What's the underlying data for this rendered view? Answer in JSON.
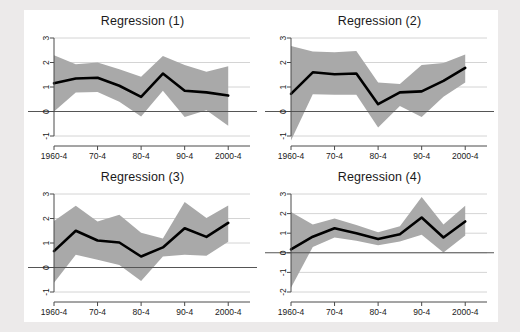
{
  "figure": {
    "background_color": "#eceaea",
    "panel_background_color": "#ffffff",
    "band_color": "#a9a9a9",
    "line_color": "#000000",
    "grid_color": "#c9c9c9",
    "zero_line_color": "#555555"
  },
  "chart_data": [
    {
      "type": "line",
      "title": "Regression (1)",
      "xlabel": "",
      "ylabel": "",
      "grid": true,
      "legend": "none",
      "xlim": [
        0,
        9
      ],
      "ylim": [
        -1,
        3
      ],
      "yticks": [
        3,
        2,
        1,
        0,
        -1
      ],
      "ytick_labels": [
        "3",
        "2",
        "1",
        "0",
        "-1"
      ],
      "xticks": [
        0,
        2,
        4,
        6,
        8
      ],
      "xtick_labels": [
        "1960-4",
        "70-4",
        "80-4",
        "90-4",
        "2000-4"
      ],
      "x": [
        0,
        1,
        2,
        3,
        4,
        5,
        6,
        7,
        8
      ],
      "series": [
        {
          "name": "coefficient",
          "values": [
            1.15,
            1.35,
            1.38,
            1.05,
            0.6,
            1.55,
            0.85,
            0.78,
            0.65
          ]
        },
        {
          "name": "ci_upper",
          "values": [
            2.3,
            1.93,
            2.0,
            1.72,
            1.42,
            2.27,
            1.9,
            1.62,
            1.85
          ]
        },
        {
          "name": "ci_lower",
          "values": [
            0.0,
            0.78,
            0.8,
            0.4,
            -0.2,
            0.85,
            -0.22,
            0.05,
            -0.58
          ]
        }
      ]
    },
    {
      "type": "line",
      "title": "Regression (2)",
      "xlabel": "",
      "ylabel": "",
      "grid": true,
      "legend": "none",
      "xlim": [
        0,
        9
      ],
      "ylim": [
        -1,
        3
      ],
      "yticks": [
        3,
        2,
        1,
        0,
        -1
      ],
      "ytick_labels": [
        "3",
        "2",
        "1",
        "0",
        "-1"
      ],
      "xticks": [
        0,
        2,
        4,
        6,
        8
      ],
      "xtick_labels": [
        "1960-4",
        "70-4",
        "80-4",
        "90-4",
        "2000-4"
      ],
      "x": [
        0,
        1,
        2,
        3,
        4,
        5,
        6,
        7,
        8
      ],
      "series": [
        {
          "name": "coefficient",
          "values": [
            0.72,
            1.6,
            1.52,
            1.55,
            0.3,
            0.78,
            0.82,
            1.25,
            1.78
          ]
        },
        {
          "name": "ci_upper",
          "values": [
            2.67,
            2.45,
            2.42,
            2.47,
            1.18,
            1.12,
            1.9,
            1.98,
            2.33
          ]
        },
        {
          "name": "ci_lower",
          "values": [
            -1.18,
            0.7,
            0.68,
            0.68,
            -0.65,
            0.22,
            -0.22,
            0.6,
            1.18
          ]
        }
      ]
    },
    {
      "type": "line",
      "title": "Regression (3)",
      "xlabel": "",
      "ylabel": "",
      "grid": true,
      "legend": "none",
      "xlim": [
        0,
        9
      ],
      "ylim": [
        -1,
        3
      ],
      "yticks": [
        3,
        2,
        1,
        0,
        -1
      ],
      "ytick_labels": [
        "3",
        "2",
        "1",
        "0",
        "-1"
      ],
      "xticks": [
        0,
        2,
        4,
        6,
        8
      ],
      "xtick_labels": [
        "1960-4",
        "70-4",
        "80-4",
        "90-4",
        "2000-4"
      ],
      "x": [
        0,
        1,
        2,
        3,
        4,
        5,
        6,
        7,
        8
      ],
      "series": [
        {
          "name": "coefficient",
          "values": [
            0.67,
            1.5,
            1.1,
            1.02,
            0.45,
            0.82,
            1.6,
            1.25,
            1.82
          ]
        },
        {
          "name": "ci_upper",
          "values": [
            1.9,
            2.52,
            1.88,
            2.15,
            1.42,
            1.18,
            2.67,
            2.02,
            2.53
          ]
        },
        {
          "name": "ci_lower",
          "values": [
            -0.62,
            0.52,
            0.32,
            0.1,
            -0.55,
            0.45,
            0.52,
            0.48,
            1.05
          ]
        }
      ]
    },
    {
      "type": "line",
      "title": "Regression (4)",
      "xlabel": "",
      "ylabel": "",
      "grid": true,
      "legend": "none",
      "xlim": [
        0,
        9
      ],
      "ylim": [
        -2,
        3
      ],
      "yticks": [
        3,
        2,
        1,
        0,
        -1,
        -2
      ],
      "ytick_labels": [
        "3",
        "2",
        "1",
        "0",
        "-1",
        "-2"
      ],
      "xticks": [
        0,
        2,
        4,
        6,
        8
      ],
      "xtick_labels": [
        "1960-4",
        "70-4",
        "80-4",
        "90-4",
        "2000-4"
      ],
      "x": [
        0,
        1,
        2,
        3,
        4,
        5,
        6,
        7,
        8
      ],
      "series": [
        {
          "name": "coefficient",
          "values": [
            0.18,
            0.82,
            1.25,
            1.0,
            0.7,
            0.95,
            1.8,
            0.78,
            1.6
          ]
        },
        {
          "name": "ci_upper",
          "values": [
            2.08,
            1.45,
            1.75,
            1.42,
            1.05,
            1.35,
            2.85,
            1.45,
            2.4
          ]
        },
        {
          "name": "ci_lower",
          "values": [
            -1.78,
            0.3,
            0.78,
            0.62,
            0.38,
            0.58,
            0.92,
            0.02,
            0.88
          ]
        }
      ]
    }
  ]
}
